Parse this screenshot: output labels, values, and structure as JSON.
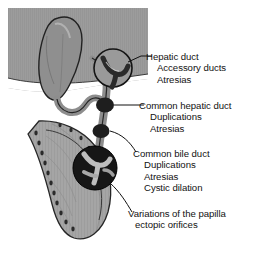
{
  "figure": {
    "caption_partial": "",
    "colors": {
      "liver_gray": "#9a9a9a",
      "duct_gray": "#8d8d8d",
      "circle_dark": "#1c1c1c",
      "leader_line": "#101010",
      "text": "#121212",
      "background": "#ffffff",
      "duodenum_light": "#b4b4b4"
    },
    "structures": [
      {
        "name": "liver",
        "label": "liver"
      },
      {
        "name": "gallbladder",
        "label": "gallbladder"
      },
      {
        "name": "cystic-duct",
        "label": "cystic duct"
      },
      {
        "name": "duodenum",
        "label": "duodenum"
      },
      {
        "name": "magnifier-hepatic",
        "label": "hepatic duct magnifier"
      },
      {
        "name": "magnifier-papilla",
        "label": "papilla magnifier"
      }
    ]
  },
  "labels": [
    {
      "heading": "Hepatic duct",
      "items": [
        "Accessory ducts",
        "Atresias"
      ]
    },
    {
      "heading": "Common hepatic duct",
      "items": [
        "Duplications",
        "Atresias"
      ]
    },
    {
      "heading": "Common bile duct",
      "items": [
        "Duplications",
        "Atresias",
        "Cystic dilation"
      ]
    },
    {
      "heading": "Variations of the papilla",
      "items": [
        "ectopic orifices"
      ]
    }
  ]
}
